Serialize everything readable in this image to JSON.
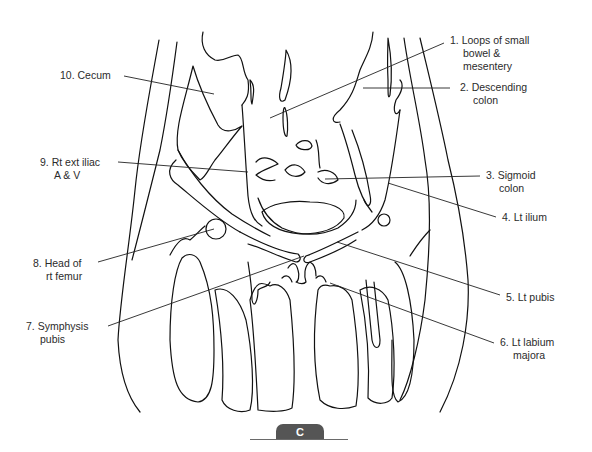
{
  "figure": {
    "panel_letter": "C",
    "line_color": "#111111",
    "tab_color": "#555555"
  },
  "labels": {
    "right": [
      {
        "num": "1.",
        "line1": "Loops of small",
        "line2": "bowel &",
        "line3": "mesentery"
      },
      {
        "num": "2.",
        "line1": "Descending",
        "line2": "colon"
      },
      {
        "num": "3.",
        "line1": "Sigmoid",
        "line2": "colon"
      },
      {
        "num": "4.",
        "line1": "Lt ilium"
      },
      {
        "num": "5.",
        "line1": "Lt pubis"
      },
      {
        "num": "6.",
        "line1": "Lt labium",
        "line2": "majora"
      }
    ],
    "left": [
      {
        "num": "7.",
        "line1": "Symphysis",
        "line2": "pubis"
      },
      {
        "num": "8.",
        "line1": "Head of",
        "line2": "rt femur"
      },
      {
        "num": "9.",
        "line1": "Rt ext iliac",
        "line2": "A & V"
      },
      {
        "num": "10.",
        "line1": "Cecum"
      }
    ]
  },
  "text": {
    "l1a": "1. Loops of small",
    "l1b": "bowel &",
    "l1c": "mesentery",
    "l2a": "2. Descending",
    "l2b": "colon",
    "l3a": "3. Sigmoid",
    "l3b": "colon",
    "l4a": "4. Lt ilium",
    "l5a": "5. Lt pubis",
    "l6a": "6. Lt labium",
    "l6b": "majora",
    "l7a": "7. Symphysis",
    "l7b": "pubis",
    "l8a": "8. Head of",
    "l8b": "rt femur",
    "l9a": "9. Rt ext iliac",
    "l9b": "A & V",
    "l10a": "10. Cecum"
  }
}
